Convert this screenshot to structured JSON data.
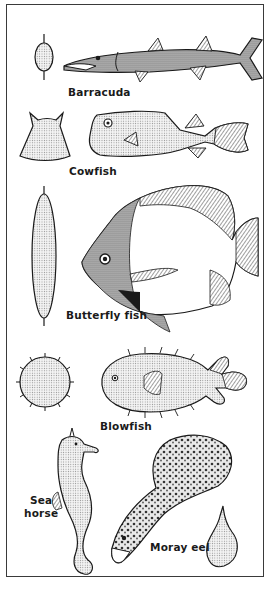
{
  "colors": {
    "ink": "#1a1a1a",
    "stipple": "#cfcfcf",
    "background": "#ffffff",
    "frame": "#3a3a3a"
  },
  "animals": [
    {
      "id": "barracuda",
      "label": "Barracuda",
      "cross_section": "narrow oval with spines top and bottom"
    },
    {
      "id": "cowfish",
      "label": "Cowfish",
      "cross_section": "trapezoid with horned top"
    },
    {
      "id": "butterfly-fish",
      "label": "Butterfly fish",
      "cross_section": "tall thin ellipse"
    },
    {
      "id": "blowfish",
      "label": "Blowfish",
      "cross_section": "spiny circle"
    },
    {
      "id": "sea-horse",
      "label_lines": [
        "Sea",
        "horse"
      ]
    },
    {
      "id": "moray-eel",
      "label": "Moray eel",
      "cross_section": "teardrop"
    }
  ]
}
